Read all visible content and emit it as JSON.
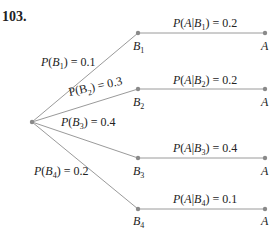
{
  "problem_number": "103.",
  "colors": {
    "line": "#9a9a9a",
    "node": "#8a8a8a",
    "text": "#222222"
  },
  "root": {
    "x": 32,
    "y": 122
  },
  "branches": [
    {
      "b_node": "B",
      "b_sub": "1",
      "p_b_label": "0.1",
      "p_a_given_b": "0.2",
      "a_node": "A",
      "y": 33
    },
    {
      "b_node": "B",
      "b_sub": "2",
      "p_b_label": "0.3",
      "p_a_given_b": "0.2",
      "a_node": "A",
      "y": 89
    },
    {
      "b_node": "B",
      "b_sub": "3",
      "p_b_label": "0.4",
      "p_a_given_b": "0.4",
      "a_node": "A",
      "y": 158
    },
    {
      "b_node": "B",
      "b_sub": "4",
      "p_b_label": "0.2",
      "p_a_given_b": "0.1",
      "a_node": "A",
      "y": 209
    }
  ],
  "labels": {
    "p_b": [
      "P(B1) = 0.1",
      "P(B2) = 0.3",
      "P(B3) = 0.4",
      "P(B4) = 0.2"
    ],
    "p_a_given_b": [
      "P(A|B1) = 0.2",
      "P(A|B2) = 0.2",
      "P(A|B3) = 0.4",
      "P(A|B4) = 0.1"
    ]
  },
  "text": {
    "P": "P",
    "open": "(",
    "close": ")",
    "eq": " = ",
    "A": "A",
    "bar": "|",
    "B": "B"
  }
}
